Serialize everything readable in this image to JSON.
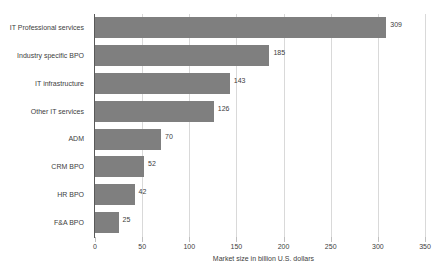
{
  "chart_data": {
    "type": "bar",
    "orientation": "horizontal",
    "title": "",
    "xlabel": "Market size in billion U.S. dollars",
    "ylabel": "",
    "categories": [
      "IT Professional services",
      "Industry specific BPO",
      "IT infrastructure",
      "Other IT services",
      "ADM",
      "CRM BPO",
      "HR BPO",
      "F&A BPO"
    ],
    "values": [
      309,
      185,
      143,
      126,
      70,
      52,
      42,
      25
    ],
    "value_labels": [
      "309",
      "185",
      "143",
      "126",
      "70",
      "52",
      "42",
      "25"
    ],
    "xlim": [
      0,
      350
    ],
    "xticks": [
      0,
      50,
      100,
      150,
      200,
      250,
      300,
      350
    ],
    "xtick_labels": [
      "0",
      "50",
      "100",
      "150",
      "200",
      "250",
      "300",
      "350"
    ],
    "grid": true,
    "grid_axis": "x",
    "legend": null,
    "bar_color": "#7f7f7f",
    "background_color": "#ffffff",
    "axis_color": "#595959",
    "gridline_color": "#d9d9d9"
  }
}
